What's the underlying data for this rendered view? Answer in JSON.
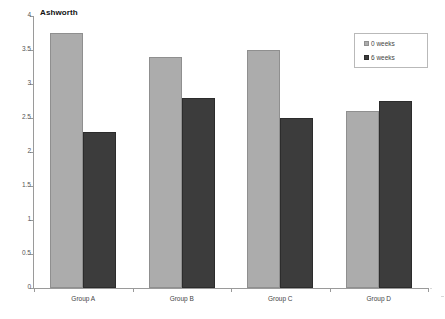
{
  "chart_data": {
    "type": "bar",
    "title": "Ashworth",
    "xlabel": "",
    "ylabel": "",
    "categories": [
      "Group A",
      "Group B",
      "Group C",
      "Group D"
    ],
    "series": [
      {
        "name": "0 weeks",
        "color": "#acacac",
        "values": [
          3.75,
          3.4,
          3.5,
          2.6
        ]
      },
      {
        "name": "6 weeks",
        "color": "#3c3c3c",
        "values": [
          2.3,
          2.8,
          2.5,
          2.75
        ]
      }
    ],
    "ylim": [
      0,
      4
    ],
    "ytick_step": 0.5,
    "yticks": [
      "0",
      "0.5",
      "1",
      "1.5",
      "2",
      "2.5",
      "3",
      "3.5",
      "4"
    ],
    "grid": false,
    "legend_position": "top-right",
    "legend_entries": [
      "0 weeks",
      "6 weeks"
    ]
  },
  "legend": {
    "entries": [
      {
        "label": "0 weeks"
      },
      {
        "label": "6 weeks"
      }
    ]
  }
}
